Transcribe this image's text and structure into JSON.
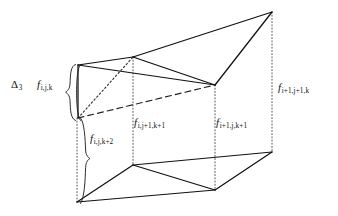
{
  "figure": {
    "domain": "diagram",
    "background_color": "#ffffff",
    "line_color": "#1a1a1a",
    "width": 338,
    "height": 216
  },
  "labels": {
    "delta3": {
      "symbol": "Δ",
      "subscript": "3",
      "name": "delta-3-operator"
    },
    "f_ijk": {
      "symbol": "f",
      "subscript": "i,j,k"
    },
    "f_ijk2": {
      "symbol": "f",
      "subscript": "i,j,k+2"
    },
    "f_ij1k1": {
      "symbol": "f",
      "subscript": "i,j+1,k+1"
    },
    "f_i1jk1": {
      "symbol": "f",
      "subscript": "i+1,j,k+1"
    },
    "f_i1j1k": {
      "symbol": "f",
      "subscript": "i+1,j+1,k"
    }
  },
  "braces": {
    "upper": {
      "name": "brace-delta3-span",
      "x": 71,
      "y_top": 64,
      "y_bottom": 121
    },
    "lower": {
      "name": "brace-fijk2-span",
      "x": 80,
      "y_top": 118,
      "y_bottom": 204
    }
  },
  "geometry": {
    "vertices": {
      "top_left": [
        78,
        65
      ],
      "top_mid": [
        133,
        57
      ],
      "top_apex": [
        272,
        12
      ],
      "right_mid": [
        215,
        85
      ],
      "left_lower": [
        78,
        118
      ],
      "bottom_left": [
        77,
        202
      ],
      "bottom_mid": [
        133,
        165
      ],
      "bottom_inner": [
        215,
        190
      ],
      "bottom_right": [
        272,
        152
      ]
    },
    "solid_edges": [
      [
        [
          78,
          65
        ],
        [
          133,
          57
        ]
      ],
      [
        [
          133,
          57
        ],
        [
          272,
          12
        ]
      ],
      [
        [
          272,
          12
        ],
        [
          215,
          85
        ]
      ],
      [
        [
          133,
          57
        ],
        [
          215,
          85
        ]
      ],
      [
        [
          78,
          65
        ],
        [
          215,
          85
        ]
      ],
      [
        [
          78,
          65
        ],
        [
          78,
          118
        ]
      ],
      [
        [
          77,
          202
        ],
        [
          133,
          165
        ]
      ],
      [
        [
          133,
          165
        ],
        [
          272,
          152
        ]
      ],
      [
        [
          272,
          152
        ],
        [
          215,
          190
        ]
      ],
      [
        [
          133,
          165
        ],
        [
          215,
          190
        ]
      ],
      [
        [
          77,
          202
        ],
        [
          215,
          190
        ]
      ]
    ],
    "dotted_edges": [
      [
        [
          78,
          118
        ],
        [
          133,
          57
        ]
      ]
    ],
    "dashed_edges": [
      [
        [
          78,
          118
        ],
        [
          215,
          85
        ]
      ]
    ],
    "dotted_verticals": [
      {
        "x": 77,
        "y1": 118,
        "y2": 202,
        "name": "vertical-guide-left"
      },
      {
        "x": 133,
        "y1": 57,
        "y2": 165,
        "name": "vertical-guide-mid"
      },
      {
        "x": 215,
        "y1": 85,
        "y2": 190,
        "name": "vertical-guide-inner"
      },
      {
        "x": 272,
        "y1": 12,
        "y2": 152,
        "name": "vertical-guide-right"
      }
    ]
  }
}
